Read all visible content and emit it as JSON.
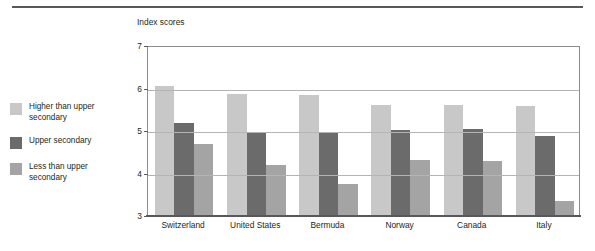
{
  "chart_data": {
    "type": "bar",
    "title": "",
    "xlabel": "",
    "ylabel": "Index scores",
    "ylim": [
      3,
      7
    ],
    "yticks": [
      3,
      4,
      5,
      6,
      7
    ],
    "grid": true,
    "legend_position": "left",
    "categories": [
      "Switzerland",
      "United States",
      "Bermuda",
      "Norway",
      "Canada",
      "Italy"
    ],
    "series": [
      {
        "name": "Higher than upper secondary",
        "color": "#c8c8c8",
        "values": [
          6.03,
          5.85,
          5.82,
          5.6,
          5.6,
          5.57
        ]
      },
      {
        "name": "Upper secondary",
        "color": "#6b6b6b",
        "values": [
          5.17,
          4.95,
          4.92,
          5.0,
          5.03,
          4.87
        ]
      },
      {
        "name": "Less than upper secondary",
        "color": "#a4a4a4",
        "values": [
          4.66,
          4.17,
          3.72,
          4.3,
          4.27,
          3.32
        ]
      }
    ]
  },
  "axis": {
    "y_title": "Index scores",
    "tick_labels": [
      "7",
      "6",
      "5",
      "4",
      "3"
    ]
  },
  "legend": {
    "items": [
      {
        "label": "Higher than upper\nsecondary",
        "color": "#c8c8c8"
      },
      {
        "label": "Upper secondary",
        "color": "#6b6b6b"
      },
      {
        "label": "Less than upper\nsecondary",
        "color": "#a4a4a4"
      }
    ]
  },
  "colors": {
    "rule": "#58585a",
    "gridline": "#b4b4b6",
    "plot_border": "#8d8d8f",
    "text": "#231f20"
  }
}
